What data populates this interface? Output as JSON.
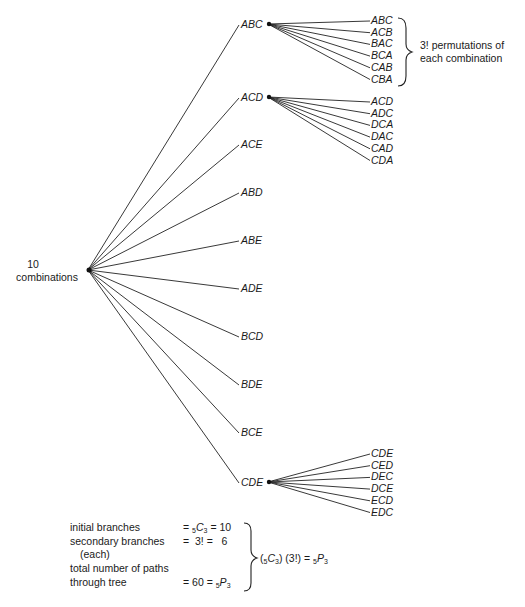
{
  "root": {
    "label_line1": "10",
    "label_line2": "combinations",
    "x": 88,
    "y": 270
  },
  "combinations": [
    {
      "label": "ABC",
      "y": 28,
      "permutations": [
        "ABC",
        "ACB",
        "BAC",
        "BCA",
        "CAB",
        "CBA"
      ],
      "perm_y0": 24
    },
    {
      "label": "ACD",
      "y": 101,
      "permutations": [
        "ACD",
        "ADC",
        "DCA",
        "DAC",
        "CAD",
        "CDA"
      ],
      "perm_y0": 105
    },
    {
      "label": "ACE",
      "y": 148,
      "permutations": []
    },
    {
      "label": "ABD",
      "y": 196,
      "permutations": []
    },
    {
      "label": "ABE",
      "y": 244,
      "permutations": []
    },
    {
      "label": "ADE",
      "y": 292,
      "permutations": []
    },
    {
      "label": "BCD",
      "y": 340,
      "permutations": []
    },
    {
      "label": "BDE",
      "y": 388,
      "permutations": []
    },
    {
      "label": "BCE",
      "y": 436,
      "permutations": []
    },
    {
      "label": "CDE",
      "y": 486,
      "permutations": [
        "CDE",
        "CED",
        "DEC",
        "DCE",
        "ECD",
        "EDC"
      ],
      "perm_y0": 457
    }
  ],
  "brace_note": {
    "line1": "3! permutations of",
    "line2": "each combination"
  },
  "summary": {
    "rows": [
      {
        "label": "initial branches",
        "expr": "= ₅C₃ = 10"
      },
      {
        "label": "secondary branches",
        "expr": "= 3! =   6"
      },
      {
        "label": "(each)",
        "expr": ""
      },
      {
        "label": "total number of paths",
        "expr": ""
      },
      {
        "label": "through tree",
        "expr": "= 60 = ₅P₃"
      }
    ],
    "result": "(₅C₃) (3!) = ₅P₃"
  }
}
